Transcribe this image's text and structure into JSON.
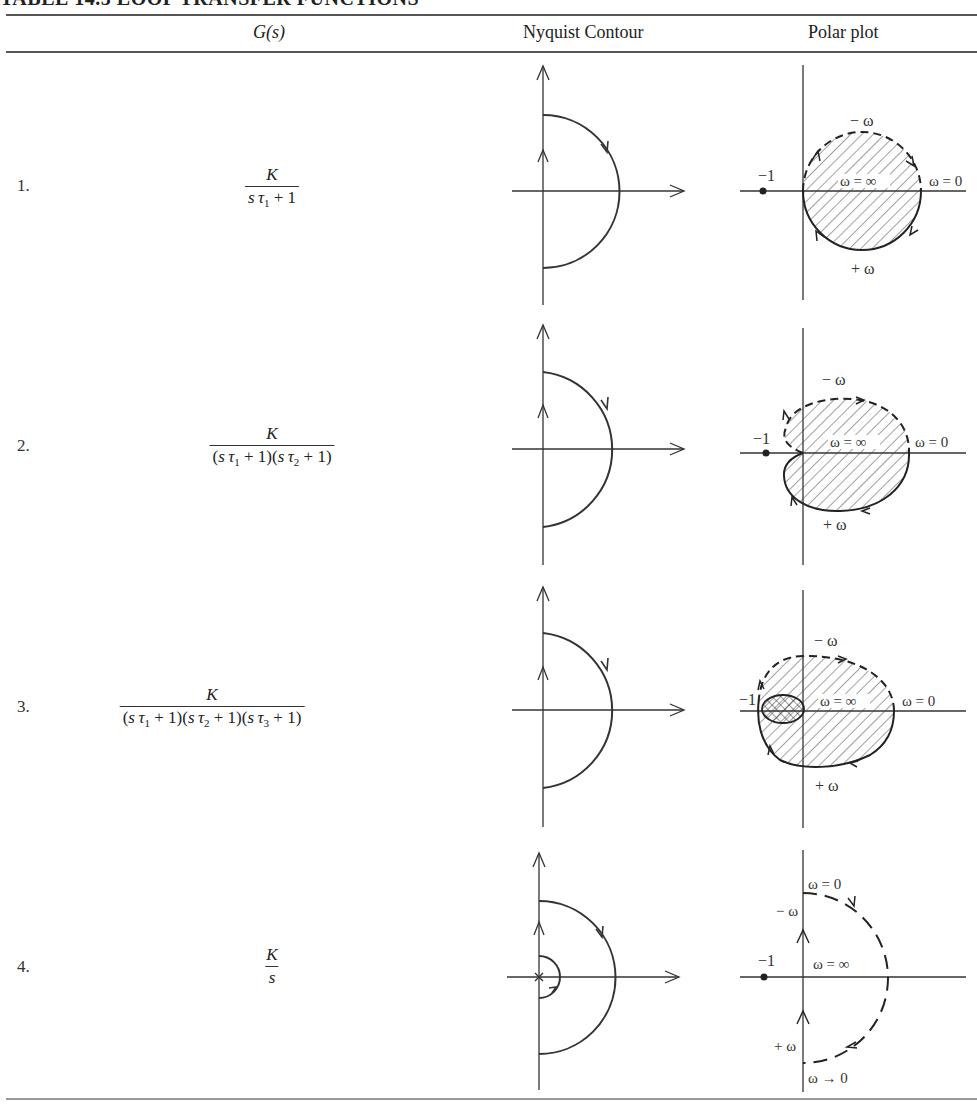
{
  "table": {
    "title": "TABLE 14.5   LOOP TRANSFER FUNCTIONS",
    "columns": [
      "G(s)",
      "Nyquist Contour",
      "Polar plot"
    ],
    "rows": [
      {
        "number": "1.",
        "numerator": "K",
        "denominator": "sτ₁ + 1",
        "nyquist_contour": "D-contour: imaginary axis with large semicircle in right half plane",
        "polar_plot": {
          "minus_omega_label": "− ω",
          "plus_omega_label": "+ ω",
          "omega_inf_label": "ω = ∞",
          "omega_zero_label": "ω = 0",
          "critical_point_label": "−1"
        }
      },
      {
        "number": "2.",
        "numerator": "K",
        "denominator": "(sτ₁ + 1)(sτ₂ + 1)",
        "nyquist_contour": "D-contour: imaginary axis with large semicircle in right half plane",
        "polar_plot": {
          "minus_omega_label": "− ω",
          "plus_omega_label": "+ ω",
          "omega_inf_label": "ω = ∞",
          "omega_zero_label": "ω = 0",
          "critical_point_label": "−1"
        }
      },
      {
        "number": "3.",
        "numerator": "K",
        "denominator": "(sτ₁ + 1)(sτ₂ + 1)(sτ₃ + 1)",
        "nyquist_contour": "D-contour: imaginary axis with large semicircle in right half plane",
        "polar_plot": {
          "minus_omega_label": "− ω",
          "plus_omega_label": "+ ω",
          "omega_inf_label": "ω = ∞",
          "omega_zero_label": "ω = 0",
          "critical_point_label": "−1"
        }
      },
      {
        "number": "4.",
        "numerator": "K",
        "denominator": "s",
        "nyquist_contour": "D-contour with small indentation around pole at origin",
        "polar_plot": {
          "minus_omega_label": "− ω",
          "plus_omega_label": "+ ω",
          "omega_inf_label": "ω = ∞",
          "omega_zero_label": "ω = 0",
          "omega_to_zero_label": "ω → 0",
          "critical_point_label": "−1"
        }
      }
    ]
  }
}
